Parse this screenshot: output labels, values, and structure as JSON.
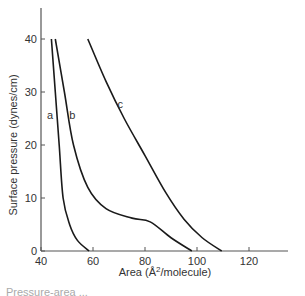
{
  "chart_data": {
    "type": "line",
    "title": "",
    "xlabel": "Area (Å²/molecule)",
    "xlabel_parts": {
      "pre": "Area (Å",
      "sup": "2",
      "post": "/molecule)"
    },
    "ylabel": "Surface pressure (dynes/cm)",
    "xlim": [
      40,
      135
    ],
    "ylim": [
      0,
      45
    ],
    "xticks": [
      40,
      60,
      80,
      100,
      120
    ],
    "yticks": [
      0,
      10,
      20,
      30,
      40
    ],
    "grid": false,
    "legend": "none (curves labelled inline)",
    "series": [
      {
        "name": "a",
        "label_pos": [
          43.5,
          25
        ],
        "x": [
          44,
          45.5,
          47,
          48.5,
          51,
          54,
          58.5
        ],
        "y": [
          40,
          30,
          20,
          10,
          5,
          2,
          0
        ]
      },
      {
        "name": "b",
        "label_pos": [
          52,
          25
        ],
        "x": [
          45.5,
          49,
          52.5,
          58,
          65,
          75,
          82,
          90,
          98
        ],
        "y": [
          40,
          30,
          20,
          12,
          8,
          6.2,
          5.5,
          2.5,
          0
        ]
      },
      {
        "name": "c",
        "label_pos": [
          70.5,
          27
        ],
        "x": [
          58,
          65,
          72,
          80,
          88,
          95,
          102,
          109.5
        ],
        "y": [
          40,
          32,
          25,
          18,
          11,
          6,
          2.5,
          0
        ]
      }
    ]
  },
  "footer": {
    "text": "Pressure-area ..."
  },
  "style": {
    "line_color": "#1a1a1a",
    "axis_color": "#555555"
  }
}
